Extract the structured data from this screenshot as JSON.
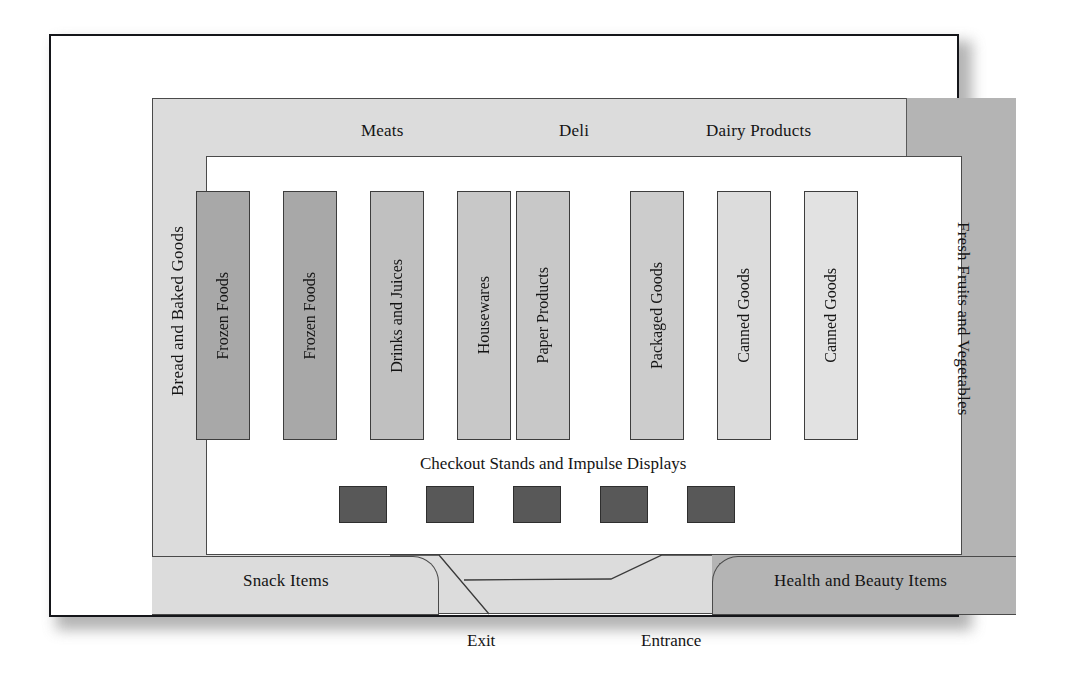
{
  "diagram": {
    "perimeter_departments": [
      {
        "name": "meats",
        "label": "Meats",
        "position": "top-left"
      },
      {
        "name": "deli",
        "label": "Deli",
        "position": "top-center"
      },
      {
        "name": "dairy",
        "label": "Dairy Products",
        "position": "top-right"
      },
      {
        "name": "bread",
        "label": "Bread and Baked Goods",
        "position": "left"
      },
      {
        "name": "produce",
        "label": "Fresh Fruits and Vegetables",
        "position": "right"
      },
      {
        "name": "snack",
        "label": "Snack Items",
        "position": "bottom-left"
      },
      {
        "name": "health",
        "label": "Health and Beauty Items",
        "position": "bottom-right"
      }
    ],
    "aisles": [
      {
        "label": "Frozen Foods",
        "x": 194,
        "shade": "#a8a8a8"
      },
      {
        "label": "Frozen Foods",
        "x": 281,
        "shade": "#a8a8a8"
      },
      {
        "label": "Drinks and Juices",
        "x": 368,
        "shade": "#c0c0c0"
      },
      {
        "label": "Housewares",
        "x": 455,
        "shade": "#c8c8c8"
      },
      {
        "label": "Paper Products",
        "x": 514,
        "shade": "#c8c8c8"
      },
      {
        "label": "Packaged Goods",
        "x": 628,
        "shade": "#cccccc"
      },
      {
        "label": "Canned Goods",
        "x": 715,
        "shade": "#dcdcdc"
      },
      {
        "label": "Canned Goods",
        "x": 802,
        "shade": "#e2e2e2"
      }
    ],
    "checkout": {
      "title": "Checkout Stands and Impulse Displays",
      "stand_count": 5,
      "stand_positions": [
        337,
        424,
        511,
        598,
        685
      ],
      "stand_color": "#585858"
    },
    "doors": [
      {
        "name": "exit",
        "label": "Exit"
      },
      {
        "name": "entrance",
        "label": "Entrance"
      }
    ],
    "colors": {
      "frame_border": "#15161a",
      "band_light": "#dcdcdc",
      "band_dark": "#b4b4b4",
      "floor": "#ffffff",
      "outline": "#4a4a4a"
    }
  }
}
